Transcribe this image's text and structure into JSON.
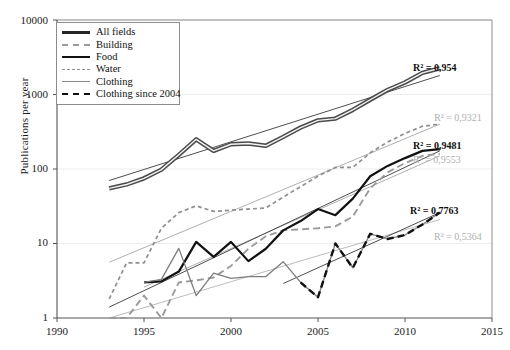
{
  "chart_data": {
    "type": "line",
    "title": "",
    "xlabel": "",
    "ylabel": "Publications per year",
    "xlim": [
      1990,
      2015
    ],
    "ylim": [
      1,
      10000
    ],
    "yscale": "log",
    "xticks": [
      1990,
      1995,
      2000,
      2005,
      2010,
      2015
    ],
    "yticks": [
      1,
      10,
      100,
      1000,
      10000
    ],
    "grid": "horizontal",
    "legend_position": "top-left",
    "series": [
      {
        "name": "All fields",
        "style": "solid-thick-dark",
        "color": "#262626",
        "x": [
          1993,
          1994,
          1995,
          1996,
          1997,
          1998,
          1999,
          2000,
          2001,
          2002,
          2003,
          2004,
          2005,
          2006,
          2007,
          2008,
          2009,
          2010,
          2011,
          2012
        ],
        "values": [
          55,
          62,
          75,
          98,
          155,
          250,
          175,
          215,
          220,
          205,
          270,
          360,
          450,
          475,
          620,
          850,
          1150,
          1450,
          1950,
          2250
        ]
      },
      {
        "name": "Building",
        "style": "dashed-long-gray",
        "color": "#9a9a9a",
        "x": [
          1993,
          1994,
          1995,
          1996,
          1997,
          1998,
          1999,
          2000,
          2001,
          2002,
          2003,
          2004,
          2005,
          2006,
          2007,
          2008,
          2009,
          2010,
          2011,
          2012
        ],
        "values": [
          1.0,
          1.0,
          2.0,
          1.0,
          3.0,
          3.2,
          3.5,
          5.0,
          8.5,
          12.5,
          15.0,
          15.5,
          16.0,
          17.0,
          23.0,
          55.0,
          90.0,
          120.0,
          150.0,
          160.0
        ]
      },
      {
        "name": "Food",
        "style": "solid-thick-black",
        "color": "#111111",
        "x": [
          1995,
          1996,
          1997,
          1998,
          1999,
          2000,
          2001,
          2002,
          2003,
          2004,
          2005,
          2006,
          2007,
          2008,
          2009,
          2010,
          2011,
          2012
        ],
        "values": [
          3.0,
          3.1,
          4.2,
          10.5,
          6.6,
          10.5,
          5.8,
          8.5,
          15.0,
          20.0,
          29.0,
          24.0,
          40.0,
          80.0,
          110.0,
          140.0,
          175.0,
          185.0
        ]
      },
      {
        "name": "Water",
        "style": "dashed-short-gray",
        "color": "#8f8f8f",
        "x": [
          1993,
          1994,
          1995,
          1996,
          1997,
          1998,
          1999,
          2000,
          2001,
          2002,
          2003,
          2004,
          2005,
          2006,
          2007,
          2008,
          2009,
          2010,
          2011,
          2012
        ],
        "values": [
          1.8,
          5.5,
          5.5,
          16.0,
          26.0,
          32.0,
          27.0,
          28.0,
          29.0,
          30.0,
          42.0,
          58.0,
          80.0,
          105.0,
          105.0,
          165.0,
          230.0,
          300.0,
          375.0,
          400.0
        ]
      },
      {
        "name": "Clothing",
        "style": "solid-thin-gray",
        "color": "#7d7d7d",
        "x": [
          1995,
          1996,
          1997,
          1998,
          1999,
          2000,
          2001,
          2002,
          2003,
          2004,
          2005,
          2006,
          2007,
          2008,
          2009,
          2010,
          2011,
          2012
        ],
        "values": [
          3.0,
          3.3,
          8.6,
          2.0,
          4.0,
          3.4,
          3.6,
          3.6,
          5.7,
          3.0,
          1.9,
          10.0,
          4.7,
          13.5,
          11.5,
          13.0,
          18.0,
          26.0
        ]
      },
      {
        "name": "Clothing since 2004",
        "style": "dashed-thick-black",
        "color": "#111111",
        "x": [
          2004,
          2005,
          2006,
          2007,
          2008,
          2009,
          2010,
          2011,
          2012
        ],
        "values": [
          3.0,
          1.9,
          10.0,
          4.7,
          13.5,
          11.5,
          13.0,
          18.0,
          26.0
        ]
      }
    ],
    "trendlines": [
      {
        "name": "All fields trend",
        "color": "#3a3a3a",
        "x": [
          1993,
          2012
        ],
        "y": [
          70,
          1800
        ],
        "r2": "0,954"
      },
      {
        "name": "Building trend",
        "color": "#a6a6a6",
        "x": [
          1995,
          2012
        ],
        "y": [
          2.6,
          150
        ],
        "r2": "0,9553"
      },
      {
        "name": "Food trend",
        "color": "#3a3a3a",
        "x": [
          1993,
          2012
        ],
        "y": [
          1.4,
          175
        ],
        "r2": "0,9481"
      },
      {
        "name": "Water trend",
        "color": "#a6a6a6",
        "x": [
          1993,
          2012
        ],
        "y": [
          5.6,
          400
        ],
        "r2": "0,9321"
      },
      {
        "name": "Clothing trend",
        "color": "#b4b4b4",
        "x": [
          1993,
          2012
        ],
        "y": [
          1.0,
          21
        ],
        "r2": "0,5364"
      },
      {
        "name": "Clothing since 2004 trend",
        "color": "#3a3a3a",
        "x": [
          2003,
          2012
        ],
        "y": [
          2.9,
          26
        ],
        "r2": "0,7763"
      }
    ],
    "annotations": [
      {
        "id": "r2-all-fields",
        "text": "R² = 0,954",
        "emphasis": "bold",
        "series": "All fields"
      },
      {
        "id": "r2-water",
        "text": "R² = 0,9321",
        "emphasis": "gray",
        "series": "Water"
      },
      {
        "id": "r2-food",
        "text": "R² = 0,9481",
        "emphasis": "bold",
        "series": "Food"
      },
      {
        "id": "r2-building",
        "text": "R² = 0,9553",
        "emphasis": "gray",
        "series": "Building"
      },
      {
        "id": "r2-clothing04",
        "text": "R² = 0,7763",
        "emphasis": "bold",
        "series": "Clothing since 2004"
      },
      {
        "id": "r2-clothing",
        "text": "R² = 0,5364",
        "emphasis": "gray",
        "series": "Clothing"
      }
    ]
  },
  "axis": {
    "y_title": "Publications per year",
    "y_ticks": [
      "10000",
      "1000",
      "100",
      "10",
      "1"
    ],
    "x_ticks": [
      "1990",
      "1995",
      "2000",
      "2005",
      "2010",
      "2015"
    ]
  },
  "legend": {
    "items": [
      {
        "label": "All fields"
      },
      {
        "label": "Building"
      },
      {
        "label": "Food"
      },
      {
        "label": "Water"
      },
      {
        "label": "Clothing"
      },
      {
        "label": "Clothing since 2004"
      }
    ]
  },
  "r2_labels": {
    "all_fields": "R² = 0,954",
    "water": "R² = 0,9321",
    "food": "R² = 0,9481",
    "building": "R² = 0,9553",
    "clothing_since_2004": "R² = 0,7763",
    "clothing": "R² = 0,5364"
  },
  "colors": {
    "axis": "#555555",
    "grid": "#ededed",
    "dark": "#1a1a1a",
    "gray": "#9a9a9a",
    "light_gray": "#b4b4b4"
  }
}
